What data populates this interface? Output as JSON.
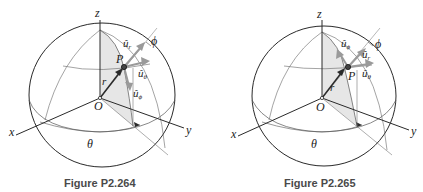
{
  "figures": [
    {
      "id": "left",
      "caption": "Figure P2.264",
      "labels": {
        "z": "z",
        "x": "x",
        "y": "y",
        "O": "O",
        "P": "P",
        "r": "r⃗",
        "theta": "θ",
        "phi": "ϕ",
        "u_r": "û",
        "u_r_sub": "r",
        "u_theta": "û",
        "u_theta_sub": "θ",
        "u_phi": "û",
        "u_phi_sub": "ϕ"
      },
      "u_phi_direction": "down"
    },
    {
      "id": "right",
      "caption": "Figure P2.265",
      "labels": {
        "z": "z",
        "x": "x",
        "y": "y",
        "O": "O",
        "P": "P",
        "r": "r⃗",
        "theta": "θ",
        "phi": "ϕ",
        "u_r": "û",
        "u_r_sub": "r",
        "u_theta": "û",
        "u_theta_sub": "θ",
        "u_phi": "û",
        "u_phi_sub": "ϕ"
      },
      "u_phi_direction": "up"
    }
  ],
  "colors": {
    "line": "#2a2a2a",
    "thin_line": "#555555",
    "shade": "#e4e4e4",
    "vector_gray": "#9a9a9a",
    "caption": "#4a4a4a"
  }
}
